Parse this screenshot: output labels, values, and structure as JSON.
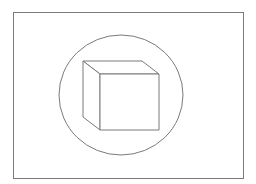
{
  "diagram": {
    "stroke_color": "#7a7a7a",
    "background": "#ffffff",
    "frame": {
      "x": 13,
      "y": 12,
      "width": 230,
      "height": 166
    },
    "circle": {
      "cx": 121,
      "cy": 95,
      "rx": 62,
      "ry": 60
    },
    "cube": {
      "front_face": "100,74 159,74 159,130 100,130",
      "top_face": "83,61 142,61 159,74 100,74",
      "left_face": "83,61 100,74 100,130 83,117"
    }
  }
}
